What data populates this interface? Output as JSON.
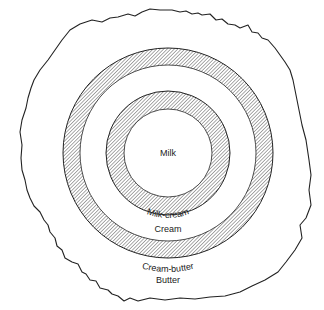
{
  "diagram": {
    "type": "concentric-zones",
    "labels": {
      "center": "Milk",
      "ring1": "Milk-cream",
      "zone2": "Cream",
      "ring2": "Cream-butter",
      "outer": "Butter"
    },
    "zones": [
      {
        "name": "Milk",
        "kind": "region",
        "order": 1
      },
      {
        "name": "Milk-cream",
        "kind": "transition-band",
        "order": 2
      },
      {
        "name": "Cream",
        "kind": "region",
        "order": 3
      },
      {
        "name": "Cream-butter",
        "kind": "transition-band",
        "order": 4
      },
      {
        "name": "Butter",
        "kind": "region",
        "order": 5
      }
    ],
    "colors": {
      "line": "#222222",
      "hatch": "#555555",
      "background": "#ffffff"
    }
  }
}
